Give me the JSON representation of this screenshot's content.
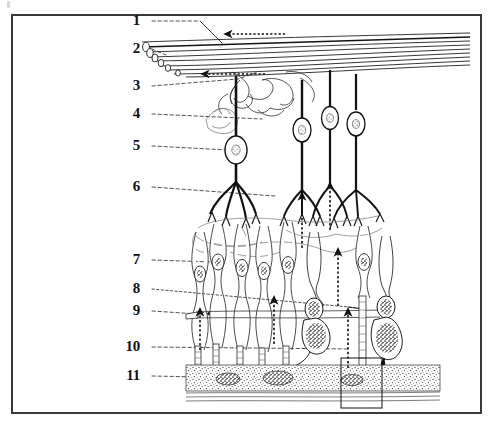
{
  "figure": {
    "kind": "labeled-anatomical-diagram",
    "border_color": "#3a3a3a",
    "ink_color": "#111111",
    "background": "#ffffff"
  },
  "labels": [
    {
      "id": "1",
      "text": "1",
      "x": 140,
      "y": 20,
      "leader_to_x": 218,
      "leader_to_y": 44
    },
    {
      "id": "2",
      "text": "2",
      "x": 140,
      "y": 48,
      "leader_to_x": 155,
      "leader_to_y": 58
    },
    {
      "id": "3",
      "text": "3",
      "x": 140,
      "y": 85,
      "leader_to_x": 255,
      "leader_to_y": 73
    },
    {
      "id": "4",
      "text": "4",
      "x": 140,
      "y": 113,
      "leader_to_x": 300,
      "leader_to_y": 126
    },
    {
      "id": "5",
      "text": "5",
      "x": 140,
      "y": 145,
      "leader_to_x": 236,
      "leader_to_y": 150
    },
    {
      "id": "6",
      "text": "6",
      "x": 140,
      "y": 186,
      "leader_to_x": 281,
      "leader_to_y": 196
    },
    {
      "id": "7",
      "text": "7",
      "x": 140,
      "y": 259,
      "leader_to_x": 219,
      "leader_to_y": 262
    },
    {
      "id": "8",
      "text": "8",
      "x": 140,
      "y": 288,
      "leader_to_x": 356,
      "leader_to_y": 309
    },
    {
      "id": "9",
      "text": "9",
      "x": 140,
      "y": 310,
      "leader_to_x": 205,
      "leader_to_y": 315
    },
    {
      "id": "10",
      "text": "10",
      "x": 132,
      "y": 346,
      "leader_to_x": 345,
      "leader_to_y": 348
    },
    {
      "id": "11",
      "text": "11",
      "x": 132,
      "y": 375,
      "leader_to_x": 300,
      "leader_to_y": 379
    }
  ],
  "layers": [
    {
      "name": "nerve-fibre-layer",
      "top": 30,
      "bottom": 75
    },
    {
      "name": "ganglion-cell-layer",
      "top": 95,
      "bottom": 175
    },
    {
      "name": "inner-plexiform-layer",
      "top": 175,
      "bottom": 225
    },
    {
      "name": "inner-nuclear-layer",
      "top": 225,
      "bottom": 300
    },
    {
      "name": "outer-plexiform-layer",
      "top": 300,
      "bottom": 320
    },
    {
      "name": "outer-nuclear-layer",
      "top": 320,
      "bottom": 358
    },
    {
      "name": "photoreceptor-segments",
      "top": 330,
      "bottom": 365
    },
    {
      "name": "pigment-epithelium",
      "top": 365,
      "bottom": 400
    }
  ],
  "callout_box": {
    "x": 341,
    "y": 358,
    "width": 41,
    "height": 50
  },
  "signal_arrows": {
    "count": 6,
    "direction": "upward",
    "style": "dashed"
  }
}
